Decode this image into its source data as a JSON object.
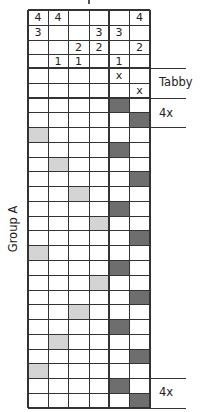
{
  "diagram": {
    "type": "weaving-draft",
    "colors": {
      "dark_fill": "#6e6e6e",
      "light_fill": "#d4d4d4",
      "grid_line": "#333333",
      "background": "#ffffff"
    },
    "threading": {
      "columns": 6,
      "rows": [
        [
          "4",
          "4",
          "",
          "",
          "",
          "4"
        ],
        [
          "3",
          "",
          "",
          "3",
          "3",
          ""
        ],
        [
          "",
          "",
          "2",
          "2",
          "",
          "2"
        ],
        [
          "",
          "1",
          "1",
          "",
          "1",
          ""
        ]
      ]
    },
    "tabby": {
      "label": "Tabby",
      "rows": [
        [
          "",
          "",
          "",
          "",
          "x",
          ""
        ],
        [
          "",
          "",
          "",
          "",
          "",
          "x"
        ]
      ]
    },
    "treadling": {
      "group_label": "Group A",
      "repeat_top_label": "4x",
      "repeat_bottom_label": "4x",
      "rows": [
        {
          "col": 5,
          "shade": "dark"
        },
        {
          "col": 6,
          "shade": "dark"
        },
        {
          "col": 1,
          "shade": "light"
        },
        {
          "col": 5,
          "shade": "dark"
        },
        {
          "col": 2,
          "shade": "light"
        },
        {
          "col": 6,
          "shade": "dark"
        },
        {
          "col": 3,
          "shade": "light"
        },
        {
          "col": 5,
          "shade": "dark"
        },
        {
          "col": 4,
          "shade": "light"
        },
        {
          "col": 6,
          "shade": "dark"
        },
        {
          "col": 1,
          "shade": "light"
        },
        {
          "col": 5,
          "shade": "dark"
        },
        {
          "col": 4,
          "shade": "light"
        },
        {
          "col": 6,
          "shade": "dark"
        },
        {
          "col": 3,
          "shade": "light"
        },
        {
          "col": 5,
          "shade": "dark"
        },
        {
          "col": 2,
          "shade": "light"
        },
        {
          "col": 6,
          "shade": "dark"
        },
        {
          "col": 1,
          "shade": "light"
        },
        {
          "col": 5,
          "shade": "dark"
        },
        {
          "col": 6,
          "shade": "dark"
        }
      ]
    }
  }
}
